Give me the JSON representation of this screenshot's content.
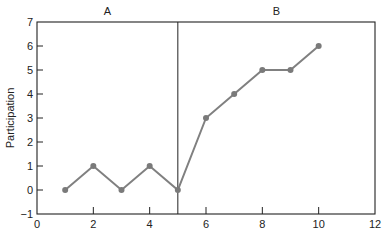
{
  "chart_data": {
    "type": "line",
    "title": "",
    "xlabel": "",
    "ylabel": "Participation",
    "xlim": [
      0,
      12
    ],
    "ylim": [
      -1,
      7
    ],
    "x_ticks": [
      0,
      2,
      4,
      6,
      8,
      10,
      12
    ],
    "y_ticks": [
      -1,
      0,
      1,
      2,
      3,
      4,
      5,
      6,
      7
    ],
    "grid": false,
    "legend": null,
    "phases": [
      {
        "label": "A",
        "x_start": 0,
        "x_end": 5
      },
      {
        "label": "B",
        "x_start": 5,
        "x_end": 12
      }
    ],
    "phase_change_line_x": 5,
    "series": [
      {
        "name": "Participation",
        "x": [
          1,
          2,
          3,
          4,
          5,
          6,
          7,
          8,
          9,
          10
        ],
        "values": [
          0,
          1,
          0,
          1,
          0,
          3,
          4,
          5,
          5,
          6
        ]
      }
    ],
    "colors": {
      "line": "#808080",
      "marker": "#7a7a7a",
      "axis": "#222222"
    }
  }
}
